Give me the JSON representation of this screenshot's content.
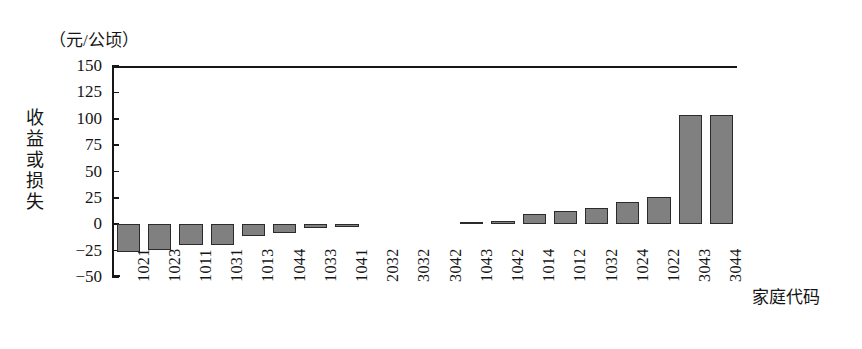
{
  "chart_data": {
    "type": "bar",
    "title": "",
    "subtitle": "",
    "unit_caption": "（元/公顷）",
    "ylabel": "收益或损失",
    "xlabel": "家庭代码",
    "ylim": [
      -50,
      150
    ],
    "ytick_values": [
      150,
      125,
      100,
      75,
      50,
      25,
      0,
      -25,
      -50
    ],
    "ytick_labels": [
      "150",
      "125",
      "100",
      "75",
      "50",
      "25",
      "0",
      "−25",
      "−50"
    ],
    "grid": false,
    "legend": "none",
    "bar_color": "#808080",
    "bar_edge_color": "#2b2b2b",
    "axis_color": "#171717",
    "background": "#ffffff",
    "categories": [
      "1021",
      "1023",
      "1011",
      "1031",
      "1013",
      "1044",
      "1033",
      "1041",
      "2032",
      "3032",
      "3042",
      "1043",
      "1042",
      "1014",
      "1012",
      "1032",
      "1024",
      "1022",
      "3043",
      "3044"
    ],
    "values": [
      -26,
      -24,
      -20,
      -20,
      -11,
      -8,
      -4,
      -3,
      0,
      0,
      0,
      2,
      3,
      10,
      13,
      15,
      21,
      26,
      104,
      104
    ]
  }
}
